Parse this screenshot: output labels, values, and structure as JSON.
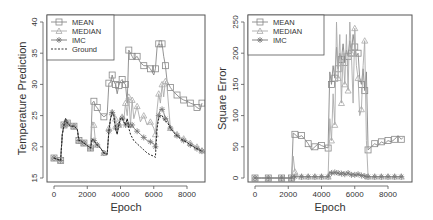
{
  "chart_data": [
    {
      "type": "line",
      "title": "",
      "xlabel": "Epoch",
      "ylabel": "Temperature Prediction",
      "xlim": [
        0,
        9000
      ],
      "ylim": [
        15,
        40
      ],
      "xticks": [
        0,
        2000,
        4000,
        6000,
        8000
      ],
      "yticks": [
        15,
        20,
        25,
        30,
        35,
        40
      ],
      "grid": false,
      "legend_position": "top-left",
      "legend": [
        "MEAN",
        "MEDIAN",
        "IMC",
        "Ground"
      ],
      "x": [
        0,
        200,
        400,
        500,
        600,
        700,
        800,
        1000,
        1200,
        1400,
        1500,
        1600,
        1800,
        2000,
        2200,
        2300,
        2400,
        2500,
        2600,
        2800,
        3000,
        3200,
        3300,
        3400,
        3500,
        3600,
        3700,
        3800,
        3900,
        4000,
        4100,
        4200,
        4300,
        4400,
        4500,
        4600,
        4700,
        4800,
        5000,
        5200,
        5400,
        5600,
        5800,
        6000,
        6100,
        6200,
        6300,
        6400,
        6500,
        6600,
        6700,
        6800,
        7000,
        7200,
        7400,
        7600,
        7800,
        8000,
        8200,
        8400,
        8600,
        8800,
        8900
      ],
      "series": [
        {
          "name": "MEAN",
          "marker": "square",
          "color": "#888888",
          "values": [
            18.2,
            18.0,
            17.8,
            22.0,
            23.5,
            24.5,
            23.8,
            23.3,
            23.3,
            22.8,
            21.0,
            21.0,
            20.6,
            20.2,
            19.8,
            27.0,
            27.3,
            26.5,
            26.3,
            25.3,
            24.8,
            25.2,
            30.2,
            30.3,
            31.5,
            30.5,
            30.0,
            28.5,
            29.8,
            30.5,
            30.8,
            30.2,
            30.0,
            27.0,
            35.5,
            35.0,
            34.5,
            34.0,
            34.5,
            33.5,
            33.0,
            33.0,
            32.5,
            31.5,
            32.5,
            36.0,
            36.5,
            36.3,
            36.5,
            34.5,
            33.0,
            30.5,
            29.5,
            28.8,
            28.3,
            27.8,
            27.5,
            27.3,
            27.0,
            26.8,
            26.3,
            26.0,
            27.0
          ]
        },
        {
          "name": "MEDIAN",
          "marker": "triangle",
          "color": "#aaaaaa",
          "values": [
            18.2,
            18.0,
            17.8,
            22.0,
            23.5,
            24.5,
            23.8,
            23.3,
            23.3,
            22.8,
            21.0,
            21.0,
            20.6,
            20.2,
            19.8,
            24.0,
            23.5,
            20.5,
            20.3,
            19.8,
            19.0,
            18.8,
            23.0,
            24.5,
            25.5,
            25.2,
            24.5,
            22.5,
            23.5,
            24.5,
            24.8,
            24.2,
            27.0,
            25.0,
            28.0,
            23.5,
            27.5,
            24.5,
            26.5,
            24.0,
            25.0,
            23.5,
            24.0,
            23.0,
            22.0,
            26.0,
            28.5,
            27.0,
            30.0,
            28.0,
            30.5,
            29.5,
            23.0,
            22.5,
            22.0,
            21.5,
            21.3,
            21.0,
            20.6,
            20.3,
            20.0,
            19.6,
            19.4
          ]
        },
        {
          "name": "IMC",
          "marker": "star",
          "color": "#777777",
          "values": [
            18.2,
            18.0,
            17.8,
            22.0,
            23.5,
            24.5,
            23.8,
            23.3,
            23.3,
            22.8,
            21.0,
            21.0,
            20.6,
            20.2,
            19.8,
            21.3,
            21.0,
            20.6,
            20.3,
            19.8,
            19.0,
            18.8,
            22.5,
            24.5,
            25.5,
            25.0,
            23.0,
            22.0,
            23.5,
            24.5,
            24.6,
            24.0,
            23.5,
            24.5,
            23.5,
            23.0,
            23.5,
            23.0,
            22.5,
            22.0,
            21.5,
            21.0,
            20.8,
            20.5,
            20.0,
            23.5,
            25.0,
            26.0,
            26.0,
            25.5,
            24.5,
            24.5,
            23.0,
            22.3,
            21.8,
            21.3,
            21.0,
            20.7,
            20.3,
            20.0,
            19.7,
            19.4,
            19.3
          ]
        },
        {
          "name": "Ground",
          "marker": "none",
          "line": "dashed",
          "color": "#222222",
          "values": [
            18.2,
            18.0,
            17.8,
            22.0,
            23.5,
            24.5,
            23.8,
            23.3,
            23.3,
            22.8,
            21.0,
            21.0,
            20.6,
            20.2,
            19.8,
            21.3,
            21.0,
            20.6,
            20.3,
            19.8,
            19.0,
            18.8,
            22.5,
            24.5,
            25.5,
            25.0,
            23.0,
            22.0,
            23.5,
            24.5,
            24.6,
            24.0,
            23.5,
            24.5,
            23.0,
            22.0,
            21.5,
            21.0,
            20.5,
            20.0,
            19.5,
            19.0,
            18.7,
            18.5,
            18.3,
            23.0,
            24.5,
            25.0,
            25.0,
            24.5,
            24.0,
            24.0,
            23.0,
            22.3,
            21.8,
            21.3,
            21.0,
            20.7,
            20.3,
            20.0,
            19.7,
            19.4,
            19.3
          ]
        }
      ]
    },
    {
      "type": "line",
      "title": "",
      "xlabel": "Epoch",
      "ylabel": "Square Error",
      "xlim": [
        0,
        9000
      ],
      "ylim": [
        0,
        250
      ],
      "xticks": [
        0,
        2000,
        4000,
        6000,
        8000
      ],
      "yticks": [
        0,
        50,
        100,
        150,
        200,
        250
      ],
      "grid": false,
      "legend_position": "top-left",
      "legend": [
        "MEAN",
        "MEDIAN",
        "IMC"
      ],
      "x": [
        0,
        400,
        800,
        1200,
        1600,
        2000,
        2200,
        2300,
        2400,
        2600,
        2800,
        3000,
        3200,
        3400,
        3600,
        3800,
        4000,
        4200,
        4400,
        4500,
        4600,
        4700,
        4800,
        4900,
        5000,
        5100,
        5200,
        5300,
        5400,
        5500,
        5600,
        5700,
        5800,
        5900,
        6000,
        6100,
        6200,
        6300,
        6400,
        6500,
        6600,
        6700,
        6800,
        7000,
        7200,
        7400,
        7600,
        7800,
        8000,
        8200,
        8400,
        8600,
        8800,
        8900
      ],
      "series": [
        {
          "name": "MEAN",
          "marker": "square",
          "color": "#888888",
          "values": [
            0,
            0,
            0,
            0,
            0,
            0,
            0,
            72,
            70,
            65,
            68,
            62,
            55,
            45,
            50,
            55,
            52,
            50,
            48,
            170,
            150,
            180,
            160,
            210,
            175,
            200,
            190,
            215,
            185,
            205,
            195,
            220,
            200,
            230,
            210,
            195,
            200,
            160,
            150,
            175,
            140,
            170,
            45,
            50,
            55,
            52,
            58,
            55,
            60,
            58,
            62,
            68,
            62,
            65
          ]
        },
        {
          "name": "MEDIAN",
          "marker": "triangle",
          "color": "#aaaaaa",
          "values": [
            0,
            0,
            0,
            0,
            0,
            0,
            0,
            35,
            10,
            3,
            2,
            2,
            2,
            2,
            2,
            2,
            2,
            2,
            2,
            95,
            60,
            135,
            85,
            250,
            160,
            230,
            120,
            200,
            150,
            230,
            140,
            250,
            200,
            120,
            240,
            180,
            160,
            100,
            110,
            180,
            220,
            60,
            2,
            2,
            2,
            2,
            2,
            2,
            2,
            2,
            2,
            2,
            2,
            2
          ]
        },
        {
          "name": "IMC",
          "marker": "star",
          "color": "#777777",
          "values": [
            0,
            0,
            0,
            0,
            0,
            0,
            0,
            3,
            2,
            2,
            2,
            2,
            2,
            2,
            2,
            2,
            2,
            2,
            2,
            10,
            8,
            7,
            9,
            6,
            8,
            5,
            7,
            10,
            6,
            5,
            8,
            6,
            5,
            7,
            5,
            4,
            6,
            5,
            4,
            5,
            3,
            2,
            2,
            2,
            2,
            2,
            2,
            2,
            2,
            2,
            2,
            2,
            2,
            2
          ]
        }
      ]
    }
  ],
  "labels": {
    "left": {
      "xlabel": "Epoch",
      "ylabel": "Temperature Prediction"
    },
    "right": {
      "xlabel": "Epoch",
      "ylabel": "Square Error"
    }
  }
}
